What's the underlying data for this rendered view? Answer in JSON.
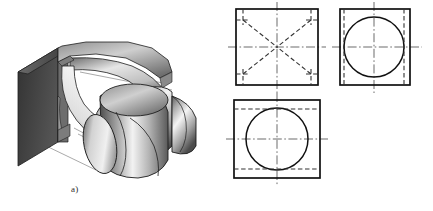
{
  "figure": {
    "background_color": "#ffffff",
    "line_color": "#1a1a1a",
    "hidden_line_color": "#333333",
    "center_line_color": "#2b2b2b"
  },
  "captions": {
    "part_a": "a)",
    "part_b": "b)"
  },
  "part_a": {
    "name": "isometric-cutaway",
    "description": "Pictorial cutaway of two intersecting cylinders with the cut section displaced to the left",
    "shading": {
      "dark": "#2e2e2e",
      "mid": "#8d8d8d",
      "light": "#e9e9e9",
      "highlight": "#f7f7f7",
      "face_dark": "#4a4a4a"
    },
    "projection_lines": 3
  },
  "part_b": {
    "name": "orthographic-projections",
    "views": [
      {
        "id": "front-view",
        "label": "front view",
        "position": "top-left",
        "outline": "square",
        "x": 236,
        "y": 9,
        "w": 82,
        "h": 76,
        "features": [
          "diagonal hidden lines forming X",
          "corner hidden line segments",
          "horizontal centerline",
          "vertical centerline"
        ]
      },
      {
        "id": "side-view",
        "label": "side view",
        "position": "top-right",
        "outline": "square",
        "x": 340,
        "y": 9,
        "w": 70,
        "h": 76,
        "features": [
          "visible circle",
          "two vertical hidden lines tangent to circle",
          "horizontal centerline",
          "vertical centerline"
        ]
      },
      {
        "id": "top-view",
        "label": "top view",
        "position": "bottom-left",
        "outline": "rectangle",
        "x": 234,
        "y": 100,
        "w": 86,
        "h": 78,
        "features": [
          "visible circle",
          "two horizontal hidden lines tangent to circle",
          "horizontal centerline",
          "vertical centerline"
        ]
      }
    ],
    "line_styles": {
      "visible": "solid",
      "hidden": "dashed",
      "center": "dash-dot"
    }
  }
}
